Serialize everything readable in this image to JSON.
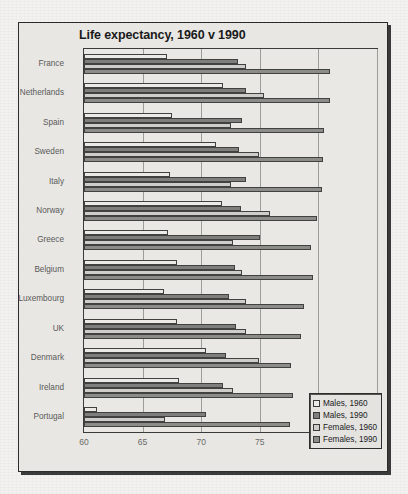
{
  "chart_data": {
    "type": "bar",
    "orientation": "horizontal",
    "title": "Life expectancy, 1960 v 1990",
    "xlabel": "",
    "ylabel": "",
    "xlim": [
      60,
      85
    ],
    "xticks": [
      60,
      65,
      70,
      75,
      80,
      85
    ],
    "grid": true,
    "legend_position": "bottom-right",
    "categories": [
      "France",
      "Netherlands",
      "Spain",
      "Sweden",
      "Italy",
      "Norway",
      "Greece",
      "Belgium",
      "Luxembourg",
      "UK",
      "Denmark",
      "Ireland",
      "Portugal"
    ],
    "series": [
      {
        "name": "Males, 1960",
        "color": "#eceae6",
        "values": [
          67.1,
          71.9,
          67.5,
          71.3,
          67.3,
          71.8,
          67.2,
          67.9,
          66.8,
          67.9,
          70.4,
          68.1,
          61.1
        ]
      },
      {
        "name": "Males, 1990",
        "color": "#7e7e7c",
        "values": [
          73.1,
          73.8,
          73.5,
          73.2,
          73.8,
          73.4,
          75.0,
          72.9,
          72.4,
          73.0,
          72.1,
          71.9,
          70.4
        ]
      },
      {
        "name": "Females, 1960",
        "color": "#cfcdc9",
        "values": [
          73.8,
          75.4,
          72.5,
          74.9,
          72.5,
          75.9,
          72.7,
          73.5,
          73.8,
          73.8,
          74.9,
          72.7,
          66.9
        ]
      },
      {
        "name": "Females, 1990",
        "color": "#8b8b88",
        "values": [
          81.0,
          81.0,
          80.5,
          80.4,
          80.3,
          79.9,
          79.4,
          79.5,
          78.8,
          78.5,
          77.7,
          77.8,
          77.6
        ]
      }
    ]
  },
  "legend": {
    "items": [
      {
        "label": "Males, 1960"
      },
      {
        "label": "Males, 1990"
      },
      {
        "label": "Females, 1960"
      },
      {
        "label": "Females, 1990"
      }
    ]
  }
}
